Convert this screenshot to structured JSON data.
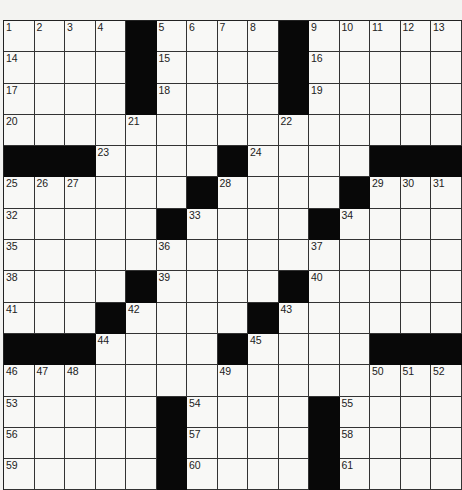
{
  "puzzle": {
    "rows": 15,
    "cols": 15,
    "layout": [
      "....#....#.....",
      "....#....#.....",
      "....#....#.....",
      "...............",
      "###....#....###",
      "......#....#...",
      ".....#....#....",
      "...............",
      "....#....#.....",
      "...#....#......",
      "###....#....###",
      "...............",
      ".....#....#....",
      ".....#....#....",
      ".....#....#...."
    ],
    "numbers": [
      [
        1,
        2,
        3,
        4,
        0,
        5,
        6,
        7,
        8,
        0,
        9,
        10,
        11,
        12,
        13
      ],
      [
        14,
        0,
        0,
        0,
        0,
        15,
        0,
        0,
        0,
        0,
        16,
        0,
        0,
        0,
        0
      ],
      [
        17,
        0,
        0,
        0,
        0,
        18,
        0,
        0,
        0,
        0,
        19,
        0,
        0,
        0,
        0
      ],
      [
        20,
        0,
        0,
        0,
        21,
        0,
        0,
        0,
        0,
        22,
        0,
        0,
        0,
        0,
        0
      ],
      [
        0,
        0,
        0,
        23,
        0,
        0,
        0,
        0,
        24,
        0,
        0,
        0,
        0,
        0,
        0
      ],
      [
        25,
        26,
        27,
        0,
        0,
        0,
        0,
        28,
        0,
        0,
        0,
        0,
        29,
        30,
        31
      ],
      [
        32,
        0,
        0,
        0,
        0,
        0,
        33,
        0,
        0,
        0,
        0,
        34,
        0,
        0,
        0
      ],
      [
        35,
        0,
        0,
        0,
        0,
        36,
        0,
        0,
        0,
        0,
        37,
        0,
        0,
        0,
        0
      ],
      [
        38,
        0,
        0,
        0,
        0,
        39,
        0,
        0,
        0,
        0,
        40,
        0,
        0,
        0,
        0
      ],
      [
        41,
        0,
        0,
        0,
        42,
        0,
        0,
        0,
        0,
        43,
        0,
        0,
        0,
        0,
        0
      ],
      [
        0,
        0,
        0,
        44,
        0,
        0,
        0,
        0,
        45,
        0,
        0,
        0,
        0,
        0,
        0
      ],
      [
        46,
        47,
        48,
        0,
        0,
        0,
        0,
        49,
        0,
        0,
        0,
        0,
        50,
        51,
        52
      ],
      [
        53,
        0,
        0,
        0,
        0,
        0,
        54,
        0,
        0,
        0,
        0,
        55,
        0,
        0,
        0
      ],
      [
        56,
        0,
        0,
        0,
        0,
        0,
        57,
        0,
        0,
        0,
        0,
        58,
        0,
        0,
        0
      ],
      [
        59,
        0,
        0,
        0,
        0,
        0,
        60,
        0,
        0,
        0,
        0,
        61,
        0,
        0,
        0
      ]
    ]
  }
}
